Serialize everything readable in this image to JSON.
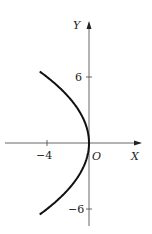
{
  "chart_data": {
    "type": "line",
    "title": "",
    "xlabel": "X",
    "ylabel": "Y",
    "origin_label": "O",
    "x_ticks": [
      {
        "value": -4,
        "label": "−4"
      }
    ],
    "y_ticks": [
      {
        "value": 6,
        "label": "6"
      },
      {
        "value": -6,
        "label": "−6"
      }
    ],
    "xlim": [
      -8.5,
      5
    ],
    "ylim": [
      -7.5,
      11
    ],
    "grid": false,
    "legend": null,
    "series": [
      {
        "name": "parabola y^2 = -9x",
        "equation": "y^2 = -9x",
        "x": [
          -4.69,
          -4.0,
          -2.78,
          -1.78,
          -1.0,
          -0.44,
          -0.11,
          0,
          -0.11,
          -0.44,
          -1.0,
          -1.78,
          -2.78,
          -4.0,
          -4.69
        ],
        "y": [
          6.5,
          6,
          5,
          4,
          3,
          2,
          1,
          0,
          -1,
          -2,
          -3,
          -4,
          -5,
          -6,
          -6.5
        ]
      }
    ]
  },
  "labels": {
    "y_axis": "Y",
    "x_axis": "X",
    "origin": "O",
    "tick_y_pos": "6",
    "tick_y_neg": "−6",
    "tick_x_neg": "−4"
  }
}
